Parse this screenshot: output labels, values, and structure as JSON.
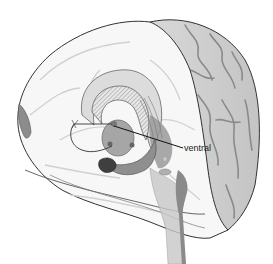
{
  "figure": {
    "style": "grayscale",
    "labels": [
      {
        "id": "ventral",
        "text": "ventral",
        "x": 183,
        "y": 146
      }
    ]
  },
  "colors": {
    "background": "#ffffff",
    "outline": "#333333",
    "cortex_fill": "#cfcfcf",
    "cortex_sulci": "#8a8a8a",
    "medial_fill": "#f6f6f6",
    "deep_structure": "#9a9a9a",
    "dark_structure": "#5a5a5a",
    "label_text": "#222222"
  }
}
